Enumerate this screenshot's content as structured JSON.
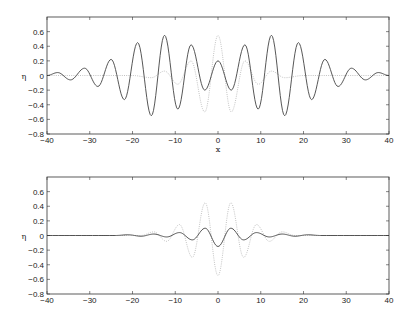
{
  "chart_data": [
    {
      "type": "line",
      "title": "",
      "xlabel": "x",
      "ylabel": "η",
      "xlim": [
        -40,
        40
      ],
      "ylim": [
        -0.8,
        0.8
      ],
      "xticks": [
        -40,
        -30,
        -20,
        -10,
        0,
        10,
        20,
        30,
        40
      ],
      "xtick_labels": [
        "-40",
        "-30",
        "-20",
        "-10",
        "0",
        "10",
        "20",
        "30",
        "40"
      ],
      "yticks": [
        0.6,
        0.4,
        0.2,
        0,
        -0.2,
        -0.4,
        -0.6,
        -0.8
      ],
      "ytick_labels": [
        "0.6",
        "0.4",
        "0.2",
        "0",
        "-0.2",
        "-0.4",
        "-0.6",
        "-0.8"
      ],
      "grid": false,
      "series": [
        {
          "name": "solid",
          "style": "solid",
          "color": "#444444",
          "x": [
            -40,
            -37.5,
            -34.5,
            -31.2,
            -28.1,
            -25,
            -21.9,
            -18.8,
            -15.6,
            -12.5,
            -9.4,
            -6.3,
            -3.1,
            0,
            3.1,
            6.3,
            9.4,
            12.5,
            15.6,
            18.8,
            21.9,
            25,
            28.1,
            31.2,
            34.5,
            37.5,
            40
          ],
          "y": [
            0,
            0.04,
            -0.06,
            0.1,
            -0.15,
            0.22,
            -0.33,
            0.45,
            -0.55,
            0.55,
            -0.46,
            0.42,
            -0.2,
            0.2,
            -0.2,
            0.42,
            -0.46,
            0.55,
            -0.55,
            0.45,
            -0.33,
            0.22,
            -0.15,
            0.1,
            -0.06,
            0.04,
            0
          ]
        },
        {
          "name": "dotted",
          "style": "dotted",
          "color": "#bbbbbb",
          "x": [
            -40,
            -20,
            -15.6,
            -12.5,
            -9.4,
            -6.3,
            -3.1,
            0,
            3.1,
            6.3,
            9.4,
            12.5,
            15.6,
            20,
            40
          ],
          "y": [
            0,
            0,
            -0.03,
            0.06,
            -0.12,
            0.2,
            -0.5,
            0.55,
            -0.5,
            0.2,
            -0.12,
            0.06,
            -0.03,
            0,
            0
          ]
        }
      ]
    },
    {
      "type": "line",
      "title": "",
      "xlabel": "",
      "ylabel": "η",
      "xlim": [
        -40,
        40
      ],
      "ylim": [
        -0.8,
        0.8
      ],
      "xticks": [
        -40,
        -30,
        -20,
        -10,
        0,
        10,
        20,
        30,
        40
      ],
      "xtick_labels": [
        "-40",
        "-30",
        "-20",
        "-10",
        "0",
        "10",
        "20",
        "30",
        "40"
      ],
      "yticks": [
        0.6,
        0.4,
        0.2,
        0,
        -0.2,
        -0.4,
        -0.6,
        -0.8
      ],
      "ytick_labels": [
        "0.6",
        "0.4",
        "0.2",
        "0",
        "-0.2",
        "-0.4",
        "-0.6",
        "-0.8"
      ],
      "grid": false,
      "series": [
        {
          "name": "solid",
          "style": "solid",
          "color": "#444444",
          "x": [
            -40,
            -24,
            -21,
            -18,
            -15,
            -12,
            -9,
            -6,
            -3,
            0,
            3,
            6,
            9,
            12,
            15,
            18,
            21,
            24,
            40
          ],
          "y": [
            0,
            0,
            0.01,
            -0.01,
            0.02,
            -0.02,
            0.04,
            -0.06,
            0.1,
            -0.15,
            0.1,
            -0.06,
            0.04,
            -0.02,
            0.02,
            -0.01,
            0.01,
            0,
            0
          ]
        },
        {
          "name": "dotted",
          "style": "dotted",
          "color": "#bbbbbb",
          "x": [
            -40,
            -18,
            -15,
            -12,
            -9,
            -6,
            -3,
            0,
            3,
            6,
            9,
            12,
            15,
            18,
            40
          ],
          "y": [
            0,
            0,
            0.05,
            -0.08,
            0.15,
            -0.3,
            0.45,
            -0.55,
            0.45,
            -0.3,
            0.15,
            -0.08,
            0.05,
            0,
            0
          ]
        }
      ]
    }
  ],
  "plots": [
    {
      "xlabel": "x",
      "ylabel": "η"
    },
    {
      "xlabel": "",
      "ylabel": "η"
    }
  ]
}
